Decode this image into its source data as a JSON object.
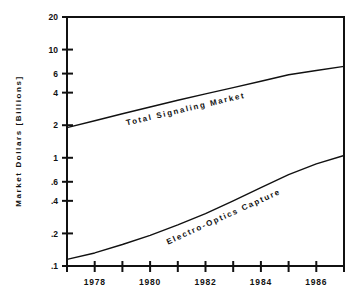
{
  "chart_data": {
    "type": "line",
    "title": "",
    "subtitle": "",
    "xlabel": "",
    "ylabel": "Market Dollars [Billions]",
    "yscale": "log",
    "xscale": "linear",
    "grid": false,
    "legend_position": "inline-labels",
    "xlim": [
      1977,
      1987
    ],
    "ylim": [
      0.1,
      20
    ],
    "xticks": [
      1977,
      1978,
      1979,
      1980,
      1981,
      1982,
      1983,
      1984,
      1985,
      1986,
      1987
    ],
    "xtick_labels": [
      "",
      "1978",
      "",
      "1980",
      "",
      "1982",
      "",
      "1984",
      "",
      "1986",
      ""
    ],
    "xtick_labels_major": [
      "1978",
      "1980",
      "1982",
      "1984",
      "1986"
    ],
    "yticks": [
      0.1,
      0.2,
      0.4,
      0.6,
      1,
      2,
      4,
      6,
      10,
      20
    ],
    "ytick_labels": [
      ".1",
      ".2",
      ".4",
      ".6",
      "1",
      "2",
      "4",
      "6",
      "10",
      "20"
    ],
    "annotations": [
      {
        "text": "Total Signaling Market",
        "series": "Total Signaling Market"
      },
      {
        "text": "Electro-Optics Capture",
        "series": "Electro-Optics Capture"
      }
    ],
    "series": [
      {
        "name": "Total Signaling Market",
        "label": "Total Signaling Market",
        "color": "#111111",
        "x": [
          1977,
          1978,
          1979,
          1980,
          1981,
          1982,
          1983,
          1984,
          1985,
          1986,
          1987
        ],
        "values": [
          1.9,
          2.2,
          2.55,
          2.95,
          3.4,
          3.9,
          4.45,
          5.1,
          5.85,
          6.4,
          7.0
        ]
      },
      {
        "name": "Electro-Optics Capture",
        "label": "Electro-Optics Capture",
        "color": "#111111",
        "x": [
          1977,
          1978,
          1979,
          1980,
          1981,
          1982,
          1983,
          1984,
          1985,
          1986,
          1987
        ],
        "values": [
          0.115,
          0.132,
          0.158,
          0.192,
          0.24,
          0.305,
          0.4,
          0.53,
          0.7,
          0.88,
          1.05
        ]
      }
    ]
  },
  "axis": {
    "ylabel": "Market Dollars [Billions]"
  }
}
